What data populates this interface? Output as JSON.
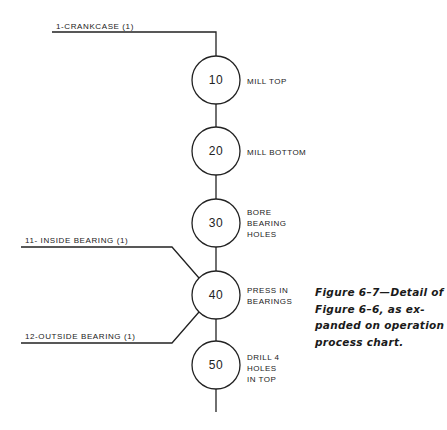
{
  "figure": {
    "caption_lines": [
      "Figure 6–7—Detail of",
      "Figure 6–6, as ex-",
      "panded on operation",
      "process chart."
    ]
  },
  "materials": [
    {
      "label": "1-CRANKCASE (1)"
    },
    {
      "label": "11- INSIDE BEARING (1)"
    },
    {
      "label": "12-OUTSIDE BEARING (1)"
    }
  ],
  "operations": [
    {
      "number": "10",
      "lines": [
        "MILL TOP"
      ]
    },
    {
      "number": "20",
      "lines": [
        "MILL BOTTOM"
      ]
    },
    {
      "number": "30",
      "lines": [
        "BORE",
        "BEARING",
        "HOLES"
      ]
    },
    {
      "number": "40",
      "lines": [
        "PRESS IN",
        "BEARINGS"
      ]
    },
    {
      "number": "50",
      "lines": [
        "DRILL 4",
        "HOLES",
        "IN TOP"
      ]
    }
  ],
  "colors": {
    "line": "#222222",
    "background": "#ffffff"
  }
}
